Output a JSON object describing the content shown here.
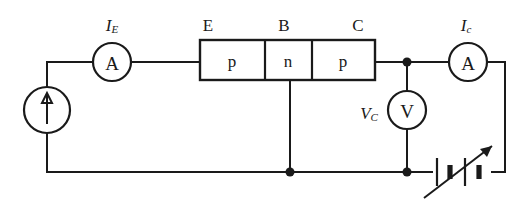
{
  "figure": {
    "kind": "circuit-diagram",
    "background_color": "#ffffff",
    "ink_color": "#1a1a1a"
  },
  "transistor": {
    "type": "pnp",
    "layers": [
      {
        "id": "emitter",
        "material": "p",
        "terminal": "E"
      },
      {
        "id": "base",
        "material": "n",
        "terminal": "B"
      },
      {
        "id": "collector",
        "material": "p",
        "terminal": "C"
      }
    ],
    "terminal_labels": {
      "emitter": "E",
      "base": "B",
      "collector": "C"
    },
    "material_labels": {
      "emitter": "p",
      "base": "n",
      "collector": "p"
    }
  },
  "meters": {
    "emitter_ammeter": {
      "symbol": "A",
      "label_main": "I",
      "label_sub": "E",
      "name": "emitter current ammeter"
    },
    "collector_ammeter": {
      "symbol": "A",
      "label_main": "I",
      "label_sub": "c",
      "name": "collector current ammeter"
    },
    "collector_voltmeter": {
      "symbol": "V",
      "label_main": "V",
      "label_sub": "C",
      "name": "collector voltage voltmeter"
    }
  },
  "sources": {
    "emitter_current_source": {
      "symbol": "current-source",
      "arrow_direction": "up",
      "name": "emitter current source"
    },
    "collector_supply": {
      "symbol": "variable-battery",
      "cells": 2,
      "variable": true,
      "name": "variable collector battery"
    }
  }
}
